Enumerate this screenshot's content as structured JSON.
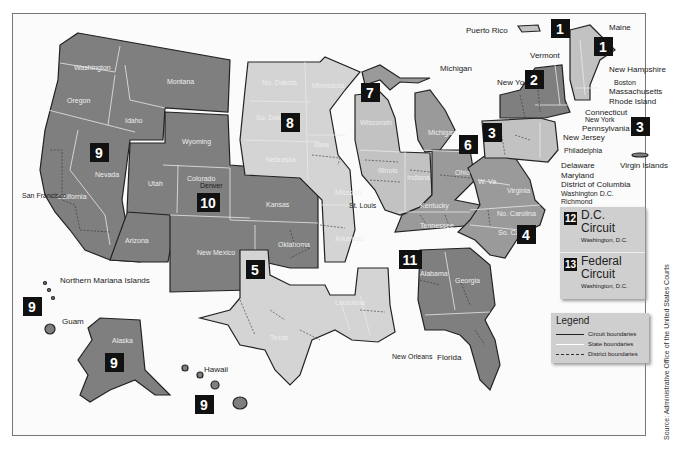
{
  "map": {
    "title": "Geographic Boundaries of United States Courts of Appeals and District Courts",
    "circuits": [
      {
        "number": "1",
        "states": [
          "Maine",
          "New Hampshire",
          "Massachusetts",
          "Rhode Island",
          "Puerto Rico"
        ],
        "seat": "Boston"
      },
      {
        "number": "2",
        "states": [
          "New York",
          "Vermont",
          "Connecticut"
        ],
        "seat": "New York"
      },
      {
        "number": "3",
        "states": [
          "Pennsylvania",
          "New Jersey",
          "Delaware",
          "Virgin Islands"
        ],
        "seat": "Philadelphia"
      },
      {
        "number": "4",
        "states": [
          "Maryland",
          "W. Va.",
          "Virginia",
          "No. Carolina",
          "So. Carolina"
        ],
        "seat": "Richmond"
      },
      {
        "number": "5",
        "states": [
          "Texas",
          "Louisiana",
          "Mississippi"
        ],
        "seat": "New Orleans"
      },
      {
        "number": "6",
        "states": [
          "Michigan",
          "Ohio",
          "Kentucky",
          "Tennessee"
        ],
        "seat": "Cincinnati"
      },
      {
        "number": "7",
        "states": [
          "Wisconsin",
          "Illinois",
          "Indiana"
        ],
        "seat": "Chicago"
      },
      {
        "number": "8",
        "states": [
          "No. Dakota",
          "So. Dakota",
          "Nebraska",
          "Minnesota",
          "Iowa",
          "Missouri",
          "Arkansas"
        ],
        "seat": "St. Louis"
      },
      {
        "number": "9",
        "states": [
          "Washington",
          "Oregon",
          "California",
          "Nevada",
          "Idaho",
          "Montana",
          "Arizona",
          "Alaska",
          "Hawaii",
          "Guam",
          "Northern Mariana Islands"
        ],
        "seat": "San Francisco"
      },
      {
        "number": "10",
        "states": [
          "Wyoming",
          "Utah",
          "Colorado",
          "Kansas",
          "New Mexico",
          "Oklahoma"
        ],
        "seat": "Denver"
      },
      {
        "number": "11",
        "states": [
          "Alabama",
          "Georgia",
          "Florida"
        ],
        "seat": "Atlanta"
      }
    ],
    "state_labels": {
      "washington": "Washington",
      "oregon": "Oregon",
      "idaho": "Idaho",
      "montana": "Montana",
      "nevada": "Nevada",
      "california": "California",
      "arizona": "Arizona",
      "wyoming": "Wyoming",
      "utah": "Utah",
      "colorado": "Colorado",
      "new_mexico": "New\nMexico",
      "kansas": "Kansas",
      "oklahoma": "Oklahoma",
      "no_dakota": "No. Dakota",
      "so_dakota": "So.\nDakota",
      "nebraska": "Nebraska",
      "minnesota": "Minnesota",
      "iowa": "Iowa",
      "missouri": "Missouri",
      "arkansas": "Arkansas",
      "texas": "Texas",
      "louisiana": "Louisiana",
      "mississippi": "Mississippi",
      "wisconsin": "Wisconsin",
      "illinois": "Illinois",
      "indiana": "Indiana",
      "michigan": "Michigan",
      "ohio": "Ohio",
      "kentucky": "Kentucky",
      "tennessee": "Tennessee",
      "alabama": "Alabama",
      "georgia": "Georgia",
      "florida": "Florida",
      "w_va": "W. Va.",
      "virginia": "Virginia",
      "no_carolina": "No. Carolina",
      "so_carolina": "So.\nCarolina",
      "pennsylvania": "Pennsylvania",
      "new_york": "New\nYork",
      "vermont": "Vermont",
      "maine": "Maine",
      "new_hampshire": "New\nHampshire",
      "massachusetts": "Massachusetts",
      "rhode_island": "Rhode Island",
      "connecticut": "Connecticut",
      "new_jersey": "New\nJersey",
      "delaware": "Delaware",
      "maryland": "Maryland",
      "district_of_columbia": "District of Columbia",
      "alaska": "Alaska",
      "hawaii": "Hawaii",
      "guam": "Guam",
      "northern_mariana": "Northern\nMariana\nIslands",
      "puerto_rico": "Puerto Rico",
      "virgin_islands": "Virgin\nIslands",
      "michigan_up": "Michigan"
    },
    "city_labels": {
      "san_francisco": "San\nFrancisco",
      "denver": "Denver",
      "st_louis": "St. Louis",
      "chicago": "Chicago",
      "new_orleans": "New Orleans",
      "atlanta": "Atlanta",
      "boston": "Boston",
      "new_york": "New York",
      "philadelphia": "Philadelphia",
      "washington_dc": "Washington D.C.",
      "richmond": "Richmond",
      "cincinnati": "Cincinnati"
    },
    "district_letters": {
      "W": "W",
      "E": "E",
      "N": "N",
      "S": "S",
      "C": "C",
      "M": "M"
    }
  },
  "dc_circuits": [
    {
      "number": "12",
      "name": "D.C. Circuit",
      "seat": "Washington, D.C."
    },
    {
      "number": "13",
      "name": "Federal Circuit",
      "seat": "Washington, D.C."
    }
  ],
  "legend": {
    "title": "Legend",
    "items": [
      {
        "label": "Circuit boundaries",
        "style": "solid-dark"
      },
      {
        "label": "State boundaries",
        "style": "solid-white"
      },
      {
        "label": "District boundaries",
        "style": "dashed"
      }
    ]
  },
  "source": "Source: Administrative Office of the United States Courts",
  "colors": {
    "circuit_dark": "#7f7f7f",
    "circuit_mid": "#9a9a9a",
    "circuit_light": "#c2c2c2",
    "circuit_lighter": "#d4d4d4",
    "badge": "#111111",
    "legend_bg": "#cfcfcf"
  }
}
